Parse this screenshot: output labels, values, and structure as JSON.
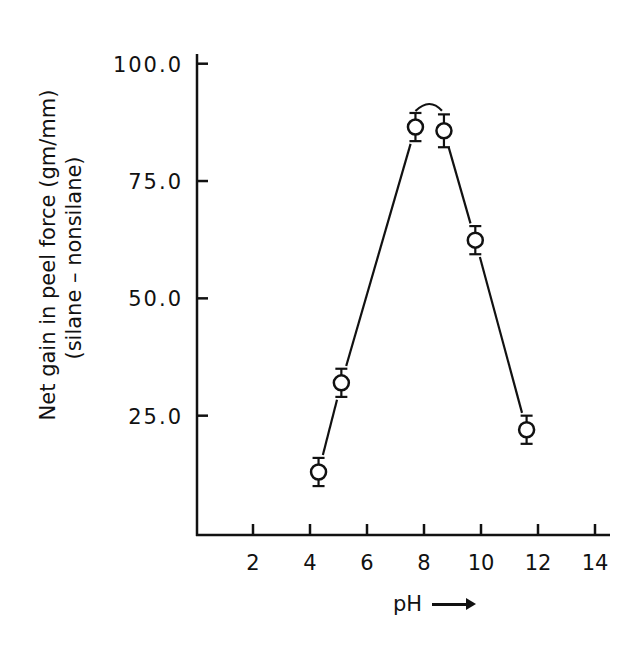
{
  "chart_data": {
    "type": "line",
    "title": "",
    "xlabel": "pH",
    "xlabel_arrow": "→",
    "ylabel": "Net gain in peel force (gm/mm)",
    "ylabel_line2": "(silane – nonsilane)",
    "xlim": [
      0,
      14.5
    ],
    "ylim": [
      0,
      102
    ],
    "xticks": [
      2,
      4,
      6,
      8,
      10,
      12,
      14
    ],
    "xtick_labels": [
      "2",
      "4",
      "6",
      "8",
      "10",
      "12",
      "14"
    ],
    "yticks": [
      25,
      50,
      75,
      100
    ],
    "ytick_labels": [
      "25.0",
      "50.0",
      "75.0",
      "100.0"
    ],
    "grid": false,
    "legend": null,
    "marker": "open-circle",
    "error_bars": true,
    "series": [
      {
        "name": "Net gain in peel force",
        "x": [
          4.3,
          5.1,
          7.7,
          8.7,
          9.8,
          11.6
        ],
        "values": [
          13,
          32,
          86.5,
          85.7,
          62.4,
          22
        ],
        "error": [
          3,
          3,
          3,
          3.5,
          3,
          3
        ]
      }
    ]
  }
}
